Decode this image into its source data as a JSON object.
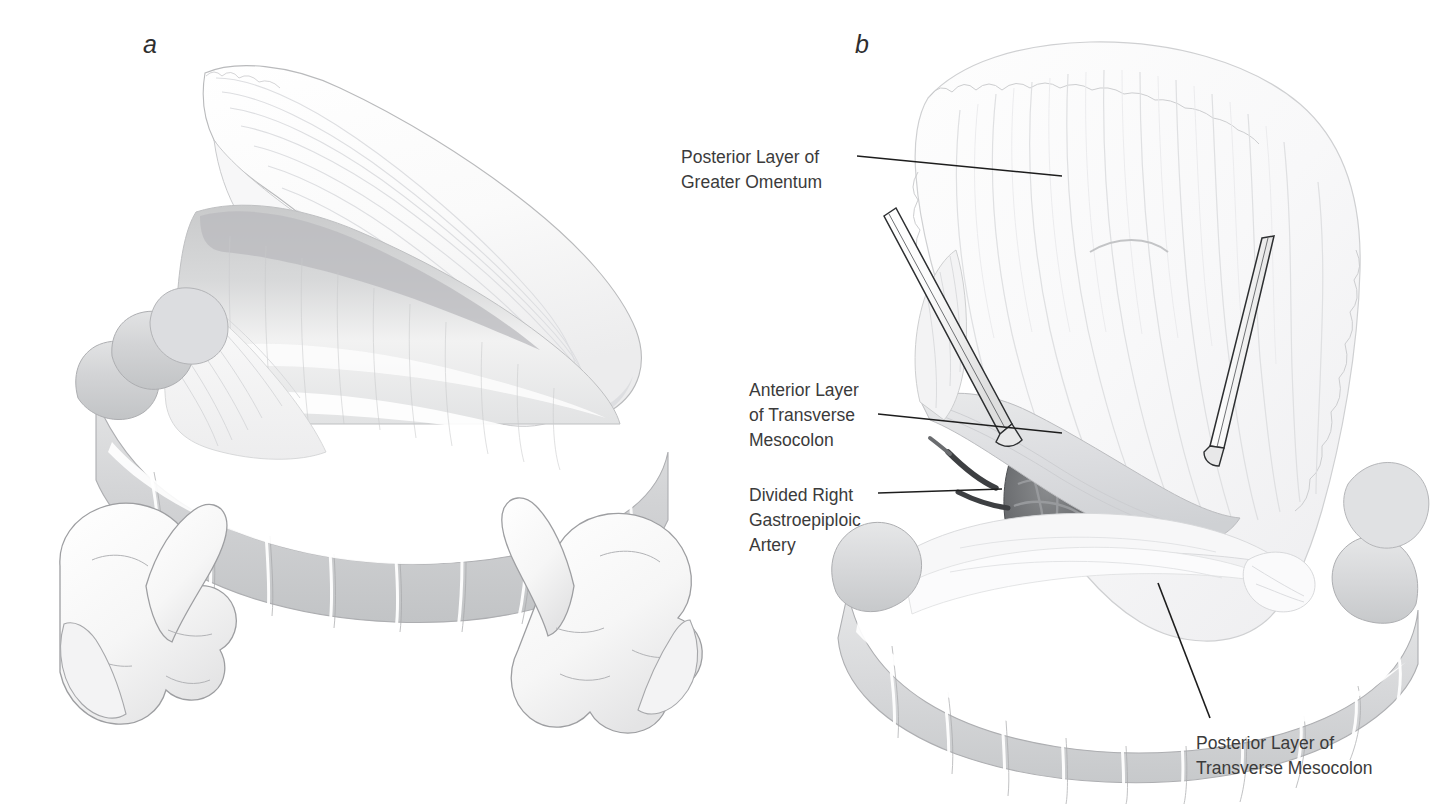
{
  "figure": {
    "background_color": "#ffffff",
    "ink_color": "#3b3b3b",
    "leader_color": "#1d1d1d",
    "panels": [
      {
        "letter": "a",
        "description": "Surgeon's two hands grasp and elevate the transverse colon; the greater omentum is reflected superiorly revealing the transverse mesocolon"
      },
      {
        "letter": "b",
        "description": "Greater omentum retracted by two clamps exposing the lesser sac with the divided right gastroepiploic artery and the layers of the transverse mesocolon"
      }
    ]
  },
  "labels": {
    "posterior_layer_greater_omentum": "Posterior Layer of\nGreater Omentum",
    "anterior_layer_transverse_mesocolon": "Anterior Layer\nof Transverse\nMesocolon",
    "divided_right_gastroepiploic_artery": "Divided Right\nGastroepiploic\nArtery",
    "posterior_layer_transverse_mesocolon": "Posterior Layer of\nTransverse Mesocolon"
  },
  "panel_letters": {
    "a": "a",
    "b": "b"
  }
}
